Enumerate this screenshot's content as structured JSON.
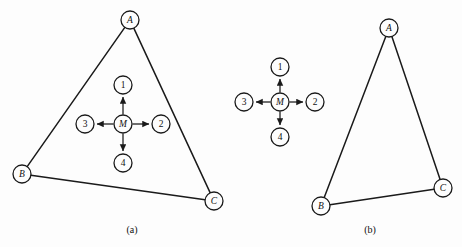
{
  "figure": {
    "background_color": "#fdfdfd",
    "stroke_color": "#1a1a1a",
    "node_fill_color": "#fdfdfd",
    "node_radius": 9,
    "width": 462,
    "height": 247
  },
  "panels": [
    {
      "id": "panel-a",
      "caption": "(a)",
      "caption_pos": {
        "x": 132,
        "y": 229
      },
      "outer_nodes": [
        {
          "id": "A",
          "label": "A",
          "x": 130,
          "y": 20,
          "style": "italic"
        },
        {
          "id": "B",
          "label": "B",
          "x": 22,
          "y": 174,
          "style": "italic"
        },
        {
          "id": "C",
          "label": "C",
          "x": 214,
          "y": 201,
          "style": "italic"
        }
      ],
      "outer_edges": [
        {
          "from": "A",
          "to": "B"
        },
        {
          "from": "A",
          "to": "C"
        },
        {
          "from": "B",
          "to": "C"
        }
      ],
      "inner_nodes": [
        {
          "id": "M",
          "label": "M",
          "x": 123,
          "y": 124,
          "style": "italic"
        },
        {
          "id": "1",
          "label": "1",
          "x": 123,
          "y": 85,
          "style": "numeric"
        },
        {
          "id": "2",
          "label": "2",
          "x": 161,
          "y": 124,
          "style": "numeric"
        },
        {
          "id": "3",
          "label": "3",
          "x": 85,
          "y": 124,
          "style": "numeric"
        },
        {
          "id": "4",
          "label": "4",
          "x": 123,
          "y": 163,
          "style": "numeric"
        }
      ],
      "inner_arrows": [
        {
          "from": "M",
          "to": "1"
        },
        {
          "from": "M",
          "to": "2"
        },
        {
          "from": "M",
          "to": "3"
        },
        {
          "from": "M",
          "to": "4"
        }
      ]
    },
    {
      "id": "panel-middle-star",
      "caption": "",
      "caption_pos": null,
      "outer_nodes": [],
      "outer_edges": [],
      "inner_nodes": [
        {
          "id": "M",
          "label": "M",
          "x": 280,
          "y": 102,
          "style": "italic"
        },
        {
          "id": "1",
          "label": "1",
          "x": 280,
          "y": 67,
          "style": "numeric"
        },
        {
          "id": "2",
          "label": "2",
          "x": 315,
          "y": 102,
          "style": "numeric"
        },
        {
          "id": "3",
          "label": "3",
          "x": 244,
          "y": 102,
          "style": "numeric"
        },
        {
          "id": "4",
          "label": "4",
          "x": 280,
          "y": 137,
          "style": "numeric"
        }
      ],
      "inner_arrows": [
        {
          "from": "M",
          "to": "1"
        },
        {
          "from": "M",
          "to": "2"
        },
        {
          "from": "M",
          "to": "3"
        },
        {
          "from": "M",
          "to": "4"
        }
      ]
    },
    {
      "id": "panel-b",
      "caption": "(b)",
      "caption_pos": {
        "x": 370,
        "y": 229
      },
      "outer_nodes": [
        {
          "id": "A",
          "label": "A",
          "x": 389,
          "y": 28,
          "style": "italic"
        },
        {
          "id": "B",
          "label": "B",
          "x": 321,
          "y": 206,
          "style": "italic"
        },
        {
          "id": "C",
          "label": "C",
          "x": 443,
          "y": 188,
          "style": "italic"
        }
      ],
      "outer_edges": [
        {
          "from": "A",
          "to": "B"
        },
        {
          "from": "A",
          "to": "C"
        },
        {
          "from": "B",
          "to": "C"
        }
      ],
      "inner_nodes": [],
      "inner_arrows": []
    }
  ]
}
